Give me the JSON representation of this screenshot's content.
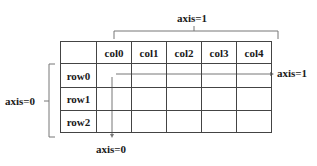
{
  "diagram": {
    "columns_header": [
      "",
      "col0",
      "col1",
      "col2",
      "col3",
      "col4"
    ],
    "rows": [
      {
        "label": "row0",
        "cells": [
          "",
          "",
          "",
          "",
          ""
        ]
      },
      {
        "label": "row1",
        "cells": [
          "",
          "",
          "",
          "",
          ""
        ]
      },
      {
        "label": "row2",
        "cells": [
          "",
          "",
          "",
          "",
          ""
        ]
      }
    ],
    "annotations": {
      "top_bracket_label": "axis=1",
      "left_bracket_label": "axis=0",
      "horizontal_arrow_label": "axis=1",
      "vertical_arrow_label": "axis=0"
    },
    "colors": {
      "grid_line": "#444444",
      "annotation_line": "#777777",
      "text": "#1a1a1a"
    }
  }
}
